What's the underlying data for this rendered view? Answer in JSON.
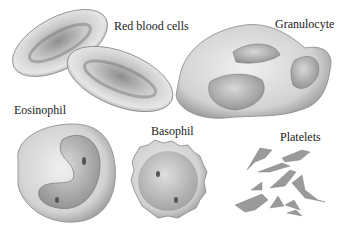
{
  "figure": {
    "labels": {
      "red_blood_cells": "Red blood cells",
      "granulocyte": "Granulocyte",
      "eosinophil": "Eosinophil",
      "basophil": "Basophil",
      "platelets": "Platelets"
    },
    "colors": {
      "background": "#ffffff",
      "cell_light": "#e4e4e4",
      "cell_mid": "#b5b5b5",
      "cell_dark": "#7a7a7a",
      "text": "#222222"
    }
  }
}
